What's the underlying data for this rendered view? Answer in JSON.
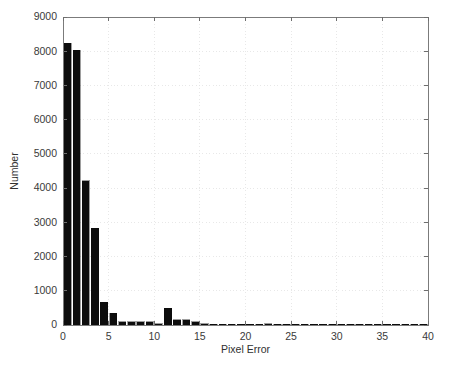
{
  "chart_data": {
    "type": "bar",
    "title": "",
    "subtitle": "",
    "xlabel": "Pixel Error",
    "ylabel": "Number",
    "xlim": [
      0,
      40
    ],
    "ylim": [
      0,
      9000
    ],
    "xticks": [
      0,
      5,
      10,
      15,
      20,
      25,
      30,
      35,
      40
    ],
    "xtick_labels": [
      "0",
      "5",
      "10",
      "15",
      "20",
      "25",
      "30",
      "35",
      "40"
    ],
    "yticks": [
      0,
      1000,
      2000,
      3000,
      4000,
      5000,
      6000,
      7000,
      8000,
      9000
    ],
    "ytick_labels": [
      "0",
      "1000",
      "2000",
      "3000",
      "4000",
      "5000",
      "6000",
      "7000",
      "8000",
      "9000"
    ],
    "grid": true,
    "legend": false,
    "bin_width": 1,
    "bar_color": "#0d0d0d",
    "categories": [
      1,
      2,
      3,
      4,
      5,
      6,
      7,
      8,
      9,
      10,
      11,
      12,
      13,
      14,
      15,
      16,
      17,
      18,
      19,
      20,
      21,
      22,
      23,
      24,
      25,
      26,
      27,
      28,
      29,
      30,
      31,
      32,
      33,
      34,
      35,
      36,
      37,
      38,
      39,
      40
    ],
    "values": [
      8240,
      8035,
      4208,
      2834,
      672,
      350,
      90,
      95,
      100,
      95,
      30,
      490,
      155,
      150,
      95,
      30,
      12,
      10,
      8,
      8,
      10,
      15,
      30,
      28,
      12,
      18,
      5,
      4,
      4,
      3,
      2,
      2,
      2,
      2,
      2,
      1,
      1,
      1,
      1,
      1
    ],
    "series": [
      {
        "name": "Pixel error histogram",
        "values": [
          8240,
          8035,
          4208,
          2834,
          672,
          350,
          90,
          95,
          100,
          95,
          30,
          490,
          155,
          150,
          95,
          30,
          12,
          10,
          8,
          8,
          10,
          15,
          30,
          28,
          12,
          18,
          5,
          4,
          4,
          3,
          2,
          2,
          2,
          2,
          2,
          1,
          1,
          1,
          1,
          1
        ]
      }
    ]
  },
  "figure": {
    "plot_left": 63,
    "plot_right": 428,
    "plot_top": 17,
    "plot_bottom": 325
  }
}
